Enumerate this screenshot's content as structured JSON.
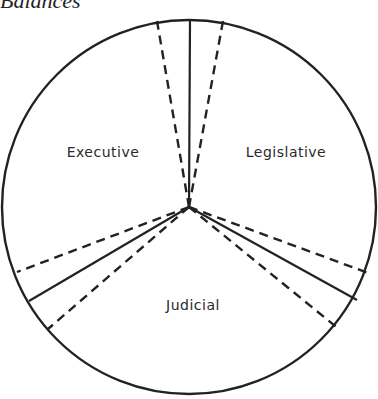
{
  "caption": "Balances",
  "diagram": {
    "type": "circle-divided",
    "center": [
      189,
      207
    ],
    "radius": 188,
    "stroke_color": "#222222",
    "sections": [
      {
        "label": "Executive",
        "x": 103,
        "y": 157
      },
      {
        "label": "Legislative",
        "x": 286,
        "y": 157
      },
      {
        "label": "Judicial",
        "x": 193,
        "y": 310
      }
    ],
    "solid_lines": [
      {
        "to": [
          190,
          15
        ]
      },
      {
        "to": [
          30,
          301
        ]
      },
      {
        "to": [
          357,
          300
        ]
      }
    ],
    "dashed_lines": [
      {
        "to": [
          157,
          18
        ]
      },
      {
        "to": [
          223,
          18
        ]
      },
      {
        "to": [
          18,
          272
        ]
      },
      {
        "to": [
          48,
          329
        ]
      },
      {
        "to": [
          370,
          275
        ]
      },
      {
        "to": [
          340,
          330
        ]
      }
    ]
  }
}
